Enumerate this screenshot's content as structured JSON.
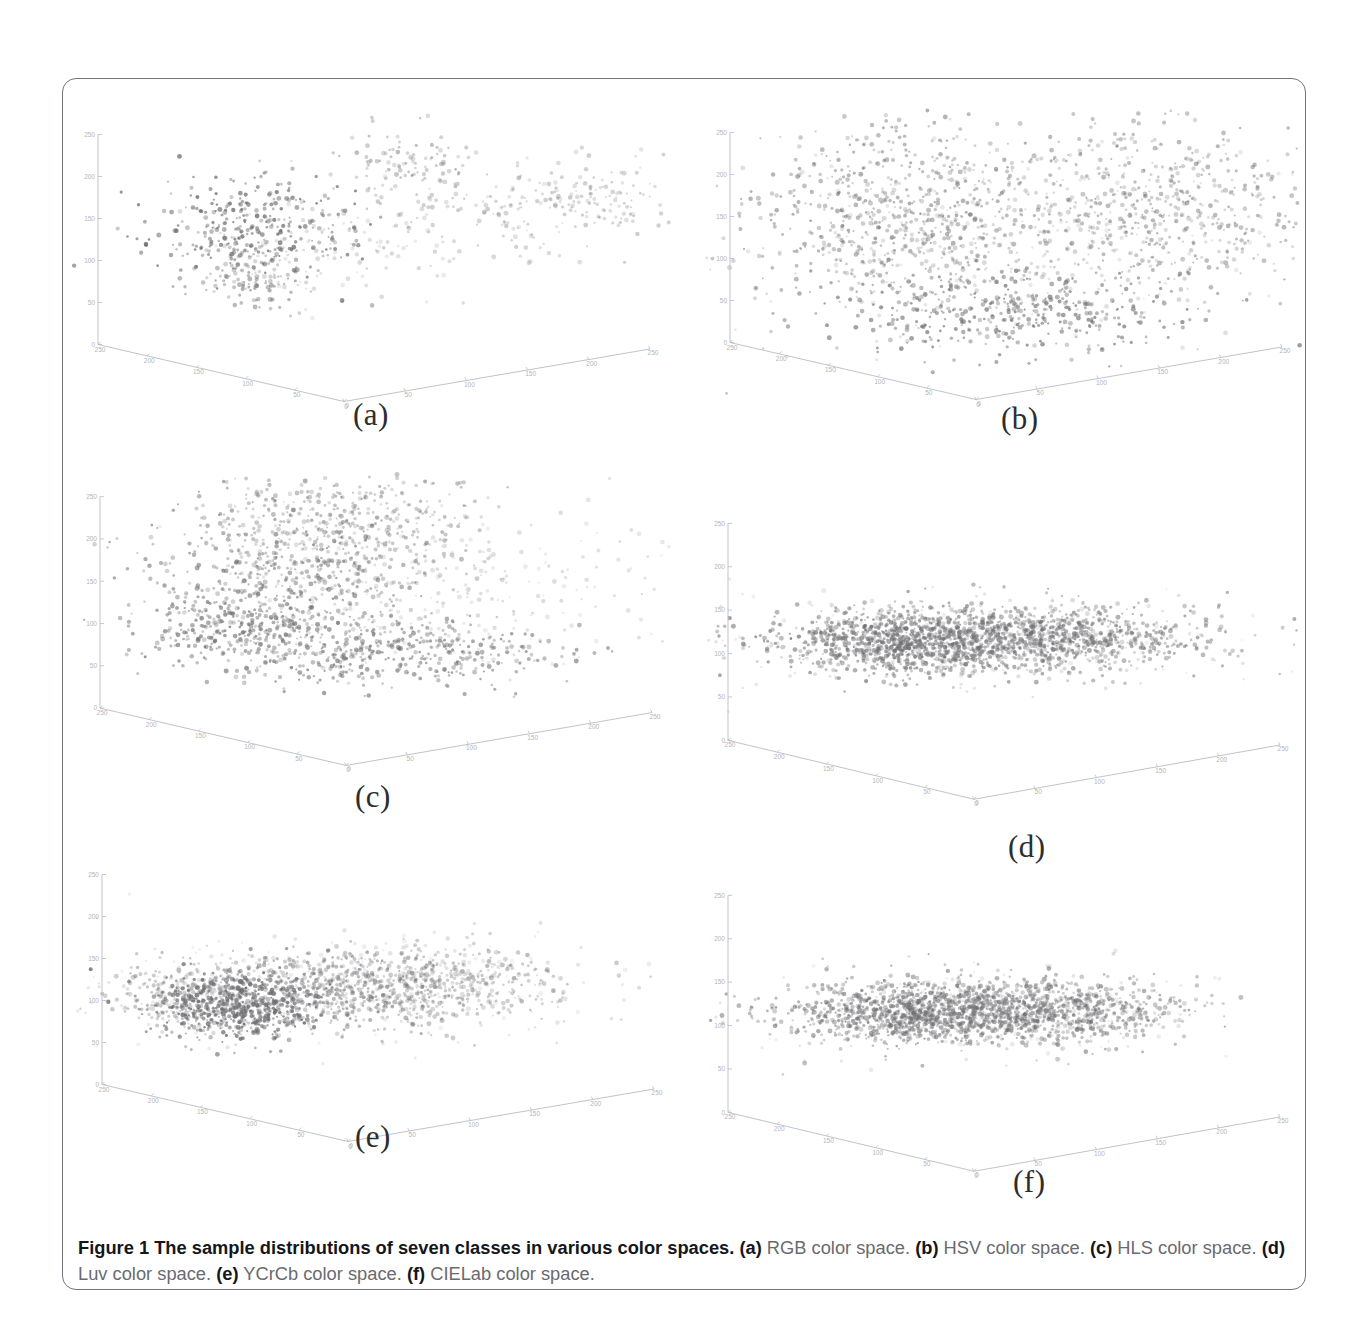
{
  "figure": {
    "id": "Figure 1",
    "caption_title": "Figure 1 The sample distributions of seven classes in various color spaces.",
    "caption_parts": [
      {
        "key": "(a)",
        "text": " RGB color space. "
      },
      {
        "key": "(b)",
        "text": " HSV color space. "
      },
      {
        "key": "(c)",
        "text": " HLS color space. "
      },
      {
        "key": "(d)",
        "text": " Luv color space. "
      },
      {
        "key": "(e)",
        "text": " YCrCb color space. "
      },
      {
        "key": "(f)",
        "text": " CIELab color space."
      }
    ],
    "num_classes": 7,
    "border_color": "#70757c",
    "background_color": "#ffffff",
    "point_color": "#6e6e72"
  },
  "panels": [
    {
      "id": "a",
      "label": "(a)",
      "color_space": "RGB"
    },
    {
      "id": "b",
      "label": "(b)",
      "color_space": "HSV"
    },
    {
      "id": "c",
      "label": "(c)",
      "color_space": "HLS"
    },
    {
      "id": "d",
      "label": "(d)",
      "color_space": "Luv"
    },
    {
      "id": "e",
      "label": "(e)",
      "color_space": "YCrCb"
    },
    {
      "id": "f",
      "label": "(f)",
      "color_space": "CIELab"
    }
  ],
  "chart_data": [
    {
      "type": "scatter",
      "panel": "a",
      "title": "RGB color space",
      "projection": "3d",
      "xlabel": "R",
      "ylabel": "G",
      "zlabel": "B",
      "xlim": [
        0,
        250
      ],
      "ylim": [
        0,
        250
      ],
      "zlim": [
        0,
        250
      ],
      "xticks": [
        0,
        50,
        100,
        150,
        200,
        250
      ],
      "yticks": [
        0,
        50,
        100,
        150,
        200,
        250
      ],
      "zticks": [
        0,
        50,
        100,
        150,
        200,
        250
      ],
      "grid": false,
      "legend": "none",
      "n_points": 900,
      "clusters": [
        {
          "cx": 0.3,
          "cy": 0.4,
          "sx": 0.085,
          "sy": 0.085,
          "n": 300,
          "alpha": 0.8
        },
        {
          "cx": 0.31,
          "cy": 0.56,
          "sx": 0.045,
          "sy": 0.075,
          "n": 120,
          "alpha": 0.55
        },
        {
          "cx": 0.57,
          "cy": 0.17,
          "sx": 0.055,
          "sy": 0.055,
          "n": 90,
          "alpha": 0.45
        },
        {
          "cx": 0.72,
          "cy": 0.33,
          "sx": 0.15,
          "sy": 0.075,
          "n": 160,
          "alpha": 0.35
        },
        {
          "cx": 0.88,
          "cy": 0.28,
          "sx": 0.09,
          "sy": 0.065,
          "n": 110,
          "alpha": 0.35
        },
        {
          "cx": 0.45,
          "cy": 0.47,
          "sx": 0.12,
          "sy": 0.09,
          "n": 120,
          "alpha": 0.28
        }
      ]
    },
    {
      "type": "scatter",
      "panel": "b",
      "title": "HSV color space",
      "projection": "3d",
      "xlabel": "H",
      "ylabel": "S",
      "zlabel": "V",
      "xlim": [
        0,
        250
      ],
      "ylim": [
        0,
        250
      ],
      "zlim": [
        0,
        250
      ],
      "xticks": [
        0,
        50,
        100,
        150,
        200,
        250
      ],
      "yticks": [
        0,
        50,
        100,
        150,
        200,
        250
      ],
      "zticks": [
        0,
        50,
        100,
        150,
        200,
        250
      ],
      "grid": false,
      "legend": "none",
      "n_points": 1900,
      "clusters": [
        {
          "cx": 0.33,
          "cy": 0.36,
          "sx": 0.13,
          "sy": 0.16,
          "n": 620,
          "alpha": 0.55
        },
        {
          "cx": 0.76,
          "cy": 0.33,
          "sx": 0.14,
          "sy": 0.15,
          "n": 520,
          "alpha": 0.5
        },
        {
          "cx": 0.52,
          "cy": 0.68,
          "sx": 0.15,
          "sy": 0.07,
          "n": 400,
          "alpha": 0.7
        },
        {
          "cx": 0.56,
          "cy": 0.42,
          "sx": 0.23,
          "sy": 0.17,
          "n": 360,
          "alpha": 0.3
        }
      ]
    },
    {
      "type": "scatter",
      "panel": "c",
      "title": "HLS color space",
      "projection": "3d",
      "xlabel": "H",
      "ylabel": "L",
      "zlabel": "S",
      "xlim": [
        0,
        250
      ],
      "ylim": [
        0,
        250
      ],
      "zlim": [
        0,
        250
      ],
      "xticks": [
        0,
        50,
        100,
        150,
        200,
        250
      ],
      "yticks": [
        0,
        50,
        100,
        150,
        200,
        250
      ],
      "zticks": [
        0,
        50,
        100,
        150,
        200,
        250
      ],
      "grid": false,
      "legend": "none",
      "n_points": 1800,
      "clusters": [
        {
          "cx": 0.36,
          "cy": 0.33,
          "sx": 0.13,
          "sy": 0.15,
          "n": 560,
          "alpha": 0.6
        },
        {
          "cx": 0.46,
          "cy": 0.17,
          "sx": 0.11,
          "sy": 0.09,
          "n": 300,
          "alpha": 0.45
        },
        {
          "cx": 0.52,
          "cy": 0.6,
          "sx": 0.15,
          "sy": 0.055,
          "n": 420,
          "alpha": 0.65
        },
        {
          "cx": 0.28,
          "cy": 0.52,
          "sx": 0.08,
          "sy": 0.055,
          "n": 230,
          "alpha": 0.7
        },
        {
          "cx": 0.62,
          "cy": 0.38,
          "sx": 0.19,
          "sy": 0.16,
          "n": 290,
          "alpha": 0.25
        }
      ]
    },
    {
      "type": "scatter",
      "panel": "d",
      "title": "Luv color space",
      "projection": "3d",
      "xlabel": "L",
      "ylabel": "u",
      "zlabel": "v",
      "xlim": [
        0,
        250
      ],
      "ylim": [
        0,
        250
      ],
      "zlim": [
        0,
        250
      ],
      "xticks": [
        0,
        50,
        100,
        150,
        200,
        250
      ],
      "yticks": [
        0,
        50,
        100,
        150,
        200,
        250
      ],
      "zticks": [
        0,
        50,
        100,
        150,
        200,
        250
      ],
      "grid": false,
      "legend": "none",
      "n_points": 2100,
      "clusters": [
        {
          "cx": 0.47,
          "cy": 0.46,
          "sx": 0.175,
          "sy": 0.055,
          "n": 1150,
          "alpha": 0.6
        },
        {
          "cx": 0.33,
          "cy": 0.47,
          "sx": 0.09,
          "sy": 0.05,
          "n": 450,
          "alpha": 0.7
        },
        {
          "cx": 0.6,
          "cy": 0.45,
          "sx": 0.11,
          "sy": 0.05,
          "n": 350,
          "alpha": 0.5
        },
        {
          "cx": 0.47,
          "cy": 0.46,
          "sx": 0.23,
          "sy": 0.08,
          "n": 200,
          "alpha": 0.22
        }
      ]
    },
    {
      "type": "scatter",
      "panel": "e",
      "title": "YCrCb color space",
      "projection": "3d",
      "xlabel": "Y",
      "ylabel": "Cr",
      "zlabel": "Cb",
      "xlim": [
        0,
        250
      ],
      "ylim": [
        0,
        250
      ],
      "zlim": [
        0,
        250
      ],
      "xticks": [
        0,
        50,
        100,
        150,
        200,
        250
      ],
      "yticks": [
        0,
        50,
        100,
        150,
        200,
        250
      ],
      "zticks": [
        0,
        50,
        100,
        150,
        200,
        250
      ],
      "grid": false,
      "legend": "none",
      "n_points": 2000,
      "clusters": [
        {
          "cx": 0.27,
          "cy": 0.52,
          "sx": 0.07,
          "sy": 0.06,
          "n": 520,
          "alpha": 0.85
        },
        {
          "cx": 0.44,
          "cy": 0.47,
          "sx": 0.11,
          "sy": 0.065,
          "n": 560,
          "alpha": 0.55
        },
        {
          "cx": 0.6,
          "cy": 0.45,
          "sx": 0.11,
          "sy": 0.06,
          "n": 420,
          "alpha": 0.4
        },
        {
          "cx": 0.2,
          "cy": 0.5,
          "sx": 0.07,
          "sy": 0.06,
          "n": 280,
          "alpha": 0.4
        },
        {
          "cx": 0.44,
          "cy": 0.45,
          "sx": 0.22,
          "sy": 0.09,
          "n": 220,
          "alpha": 0.2
        }
      ]
    },
    {
      "type": "scatter",
      "panel": "f",
      "title": "CIELab color space",
      "projection": "3d",
      "xlabel": "L",
      "ylabel": "a",
      "zlabel": "b",
      "xlim": [
        0,
        250
      ],
      "ylim": [
        0,
        250
      ],
      "zlim": [
        0,
        250
      ],
      "xticks": [
        0,
        50,
        100,
        150,
        200,
        250
      ],
      "yticks": [
        0,
        50,
        100,
        150,
        200,
        250
      ],
      "zticks": [
        0,
        50,
        100,
        150,
        200,
        250
      ],
      "grid": false,
      "legend": "none",
      "n_points": 2050,
      "clusters": [
        {
          "cx": 0.46,
          "cy": 0.46,
          "sx": 0.17,
          "sy": 0.05,
          "n": 1150,
          "alpha": 0.58
        },
        {
          "cx": 0.32,
          "cy": 0.47,
          "sx": 0.085,
          "sy": 0.05,
          "n": 420,
          "alpha": 0.62
        },
        {
          "cx": 0.58,
          "cy": 0.45,
          "sx": 0.105,
          "sy": 0.048,
          "n": 320,
          "alpha": 0.48
        },
        {
          "cx": 0.46,
          "cy": 0.46,
          "sx": 0.215,
          "sy": 0.075,
          "n": 180,
          "alpha": 0.2
        }
      ]
    }
  ]
}
